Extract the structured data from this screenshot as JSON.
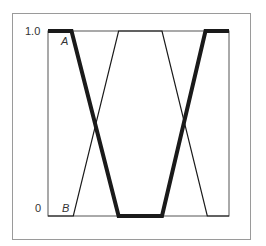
{
  "chart_data": {
    "type": "line",
    "title": "",
    "xlabel": "",
    "ylabel": "",
    "ylim": [
      0,
      1.0
    ],
    "xlim": [
      0,
      1
    ],
    "grid": false,
    "legend": "none (curves labeled inline)",
    "yticks": [
      "0",
      "1.0"
    ],
    "xticks": [],
    "series": [
      {
        "name": "A",
        "style": "thick",
        "x": [
          0.0,
          0.13,
          0.39,
          0.63,
          0.87,
          1.0
        ],
        "y": [
          1.0,
          1.0,
          0.0,
          0.0,
          1.0,
          1.0
        ]
      },
      {
        "name": "B",
        "style": "thin",
        "x": [
          0.0,
          0.14,
          0.39,
          0.63,
          0.88,
          1.0
        ],
        "y": [
          0.0,
          0.0,
          1.0,
          1.0,
          0.0,
          0.0
        ]
      }
    ]
  },
  "labels": {
    "y_top": "1.0",
    "y_bottom": "0",
    "curve_a": "A",
    "curve_b": "B"
  },
  "colors": {
    "line": "#1a1a1a",
    "axis": "#555555",
    "frame": "#9a9a9a"
  }
}
